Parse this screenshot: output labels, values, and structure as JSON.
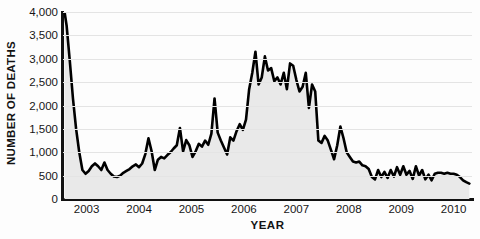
{
  "chart_data": {
    "type": "line",
    "title": "",
    "subtitle": "",
    "xlabel": "YEAR",
    "ylabel": "NUMBER OF DEATHS",
    "xlim": [
      2002.55,
      2010.35
    ],
    "ylim": [
      0,
      4000
    ],
    "grid": true,
    "legend": null,
    "fill": "area under curve, light gray",
    "line_color": "#000000",
    "fill_color": "#e9e9e9",
    "grid_color": "#e4e4e4",
    "axis_color": "#111111",
    "yticks": [
      0,
      500,
      1000,
      1500,
      2000,
      2500,
      3000,
      3500,
      4000
    ],
    "ytick_labels": [
      "0",
      "500",
      "1,000",
      "1,500",
      "2,000",
      "2,500",
      "3,000",
      "3,500",
      "4,000"
    ],
    "xticks": [
      2003,
      2004,
      2005,
      2006,
      2007,
      2008,
      2009,
      2010
    ],
    "xtick_labels": [
      "2003",
      "2004",
      "2005",
      "2006",
      "2007",
      "2008",
      "2009",
      "2010"
    ],
    "series": [
      {
        "name": "Deaths",
        "x": [
          2002.58,
          2002.62,
          2002.68,
          2002.74,
          2002.8,
          2002.86,
          2002.92,
          2002.98,
          2003.04,
          2003.1,
          2003.16,
          2003.22,
          2003.28,
          2003.34,
          2003.4,
          2003.46,
          2003.52,
          2003.58,
          2003.64,
          2003.7,
          2003.76,
          2003.82,
          2003.88,
          2003.94,
          2004.0,
          2004.06,
          2004.12,
          2004.18,
          2004.24,
          2004.3,
          2004.36,
          2004.42,
          2004.48,
          2004.54,
          2004.6,
          2004.66,
          2004.72,
          2004.78,
          2004.84,
          2004.9,
          2004.96,
          2005.02,
          2005.08,
          2005.14,
          2005.2,
          2005.26,
          2005.32,
          2005.38,
          2005.44,
          2005.5,
          2005.56,
          2005.62,
          2005.68,
          2005.74,
          2005.8,
          2005.86,
          2005.92,
          2005.98,
          2006.04,
          2006.1,
          2006.16,
          2006.22,
          2006.28,
          2006.34,
          2006.4,
          2006.46,
          2006.52,
          2006.58,
          2006.64,
          2006.7,
          2006.76,
          2006.82,
          2006.88,
          2006.94,
          2007.0,
          2007.06,
          2007.12,
          2007.18,
          2007.24,
          2007.3,
          2007.36,
          2007.42,
          2007.48,
          2007.54,
          2007.6,
          2007.66,
          2007.72,
          2007.78,
          2007.84,
          2007.9,
          2007.96,
          2008.02,
          2008.08,
          2008.14,
          2008.2,
          2008.26,
          2008.32,
          2008.38,
          2008.44,
          2008.5,
          2008.56,
          2008.62,
          2008.68,
          2008.74,
          2008.8,
          2008.86,
          2008.92,
          2008.98,
          2009.04,
          2009.1,
          2009.16,
          2009.22,
          2009.28,
          2009.34,
          2009.4,
          2009.46,
          2009.52,
          2009.58,
          2009.64,
          2009.7,
          2009.76,
          2009.82,
          2009.88,
          2009.94,
          2010.0,
          2010.06,
          2010.12,
          2010.18,
          2010.24,
          2010.3
        ],
        "values": [
          4000,
          3700,
          2950,
          2150,
          1500,
          1000,
          620,
          540,
          600,
          700,
          760,
          700,
          620,
          780,
          620,
          540,
          480,
          470,
          500,
          560,
          600,
          640,
          700,
          740,
          680,
          760,
          960,
          1300,
          1020,
          620,
          840,
          900,
          870,
          940,
          1000,
          1080,
          1150,
          1520,
          1020,
          1260,
          1150,
          900,
          1020,
          1180,
          1120,
          1250,
          1160,
          1400,
          2150,
          1420,
          1250,
          1100,
          950,
          1320,
          1250,
          1450,
          1600,
          1480,
          1700,
          2350,
          2700,
          3150,
          2450,
          2600,
          3050,
          2750,
          2800,
          2520,
          2600,
          2450,
          2700,
          2350,
          2900,
          2850,
          2550,
          2300,
          2400,
          2700,
          1950,
          2450,
          2300,
          1250,
          1200,
          1350,
          1250,
          1050,
          850,
          1150,
          1550,
          1300,
          1000,
          900,
          800,
          780,
          800,
          720,
          700,
          640,
          470,
          420,
          620,
          470,
          580,
          450,
          620,
          480,
          680,
          520,
          700,
          520,
          600,
          430,
          700,
          500,
          620,
          420,
          520,
          400,
          540,
          560,
          560,
          540,
          560,
          540,
          540,
          520,
          470,
          400,
          360,
          330
        ]
      }
    ]
  },
  "axes": {
    "y_title": "NUMBER OF DEATHS",
    "x_title": "YEAR"
  }
}
